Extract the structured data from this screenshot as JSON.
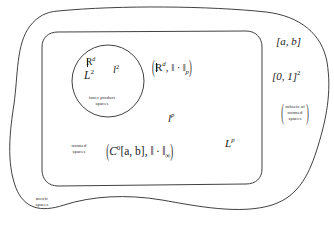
{
  "figure": {
    "background_color": "#ffffff",
    "stroke_color": "#2b2b2b"
  },
  "regions": {
    "outer": {
      "name": "metric spaces",
      "caption_line1": "metric",
      "caption_line2": "spaces",
      "shape": "wavy-blob"
    },
    "middle": {
      "name": "normed spaces",
      "caption_line1": "normed",
      "caption_line2": "spaces",
      "shape": "rounded-rectangle"
    },
    "inner": {
      "name": "inner product spaces",
      "caption_line1": "inner product",
      "caption_line2": "spaces",
      "shape": "circle"
    }
  },
  "inner_members": {
    "rd": {
      "base": "R",
      "sup": "d"
    },
    "big_l2": {
      "base": "L",
      "sup": "2"
    },
    "little_l2": {
      "base": "l",
      "sup": "2"
    }
  },
  "normed_members": {
    "rd_p_norm": {
      "open": "(",
      "base": "R",
      "sup": "d",
      "comma": ", ",
      "norm": "‖ · ‖",
      "sub": "p",
      "close": ")"
    },
    "little_lp": {
      "base": "l",
      "sup": "p"
    },
    "big_lp": {
      "base": "L",
      "sup": "p"
    },
    "c0_sup_norm": {
      "open": "(",
      "base": "C",
      "sup": "0",
      "interval": "[a, b]",
      "comma": ", ",
      "norm": "‖ · ‖",
      "sub": "∞",
      "close": ")"
    }
  },
  "outside_labels": {
    "interval_ab": "[a, b]",
    "unit_square": {
      "base": "[0, 1]",
      "sup": "2"
    },
    "subsets_note": {
      "open": "(",
      "line1": "subsets of",
      "line2": "normed",
      "line3": "spaces",
      "close": ")"
    }
  }
}
